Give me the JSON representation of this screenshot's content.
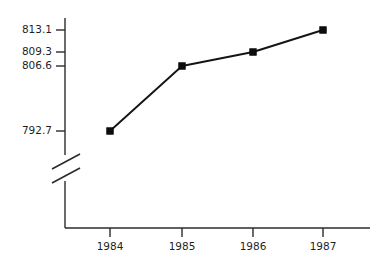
{
  "chart_data": {
    "type": "line",
    "title": "",
    "subtitle": "",
    "xlabel": "",
    "ylabel": "",
    "categories": [
      "1984",
      "1985",
      "1986",
      "1987"
    ],
    "values": [
      792.7,
      806.6,
      809.3,
      813.1
    ],
    "series": [
      {
        "name": "",
        "values": [
          792.7,
          806.6,
          809.3,
          813.1
        ]
      }
    ],
    "x_tick_labels": [
      "1984",
      "1985",
      "1986",
      "1987"
    ],
    "y_tick_labels": [
      "792.7",
      "806.6",
      "809.3",
      "813.1"
    ],
    "y_tick_values": [
      792.7,
      806.6,
      809.3,
      813.1
    ],
    "ylim": [
      792.7,
      813.1
    ],
    "grid": false,
    "legend": false,
    "legend_position": "none",
    "axis_break": {
      "present": true,
      "axis": "y",
      "style": "double-slash",
      "label": "axis-break"
    },
    "annotations": [],
    "colors": {
      "line": "#141414",
      "marker": "#0d0d0d",
      "axis": "#2b2b2b",
      "text": "#1f1f1f",
      "background": "#ffffff"
    },
    "marker_style": "filled-square",
    "points": [
      {
        "x_label": "1984",
        "y": 792.7,
        "px": 110,
        "py": 131
      },
      {
        "x_label": "1985",
        "y": 806.6,
        "px": 182,
        "py": 66
      },
      {
        "x_label": "1986",
        "y": 809.3,
        "px": 253,
        "py": 52
      },
      {
        "x_label": "1987",
        "y": 813.1,
        "px": 323,
        "py": 30
      }
    ],
    "y_tick_pixels": [
      {
        "label": "813.1",
        "py": 30
      },
      {
        "label": "809.3",
        "py": 52
      },
      {
        "label": "806.6",
        "py": 66
      },
      {
        "label": "792.7",
        "py": 131
      }
    ]
  }
}
